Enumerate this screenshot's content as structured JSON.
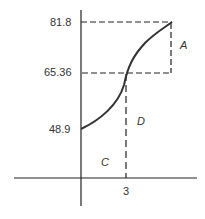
{
  "diagram": {
    "y_labels": {
      "top": "81.8",
      "mid": "65.36",
      "bottom": "48.9"
    },
    "x_label": "3",
    "regions": {
      "a": "A",
      "c": "C",
      "d": "D"
    },
    "colors": {
      "curve": "#333333",
      "axes": "#222222",
      "dashes": "#222222"
    }
  }
}
